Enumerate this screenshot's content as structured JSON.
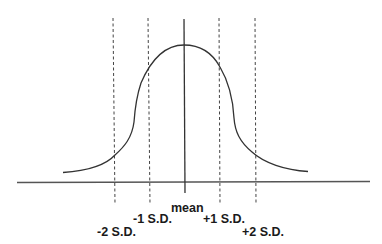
{
  "diagram": {
    "colors": {
      "background": "#ffffff",
      "line": "#333333",
      "text": "#1a1a1a"
    },
    "labels": {
      "mean": "mean",
      "minus1": "-1 S.D.",
      "minus2": "-2 S.D.",
      "plus1": "+1 S.D.",
      "plus2": "+2 S.D."
    }
  }
}
